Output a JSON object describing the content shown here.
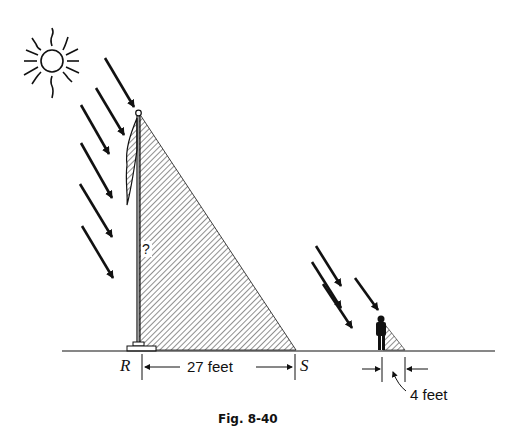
{
  "figure": {
    "caption": "Fig. 8-40",
    "unknown_height_label": "?",
    "point_r": "R",
    "point_s": "S",
    "flagpole_shadow_length": "27 feet",
    "person_shadow_length": "4 feet"
  },
  "colors": {
    "ink": "#111111",
    "background": "#ffffff"
  }
}
